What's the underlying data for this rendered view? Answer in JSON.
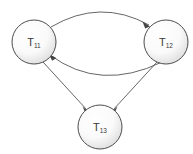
{
  "diagram": {
    "type": "directed-graph",
    "background_color": "#ffffff",
    "node_stroke_color": "#4d4d4d",
    "node_fill_light": "#fdfdfd",
    "node_fill_shadow": "#c9c9c9",
    "edge_color": "#555555",
    "label_color": "#3a3a3a",
    "nodes": [
      {
        "id": "T11",
        "label_base": "T",
        "label_subscript": "11",
        "cx": 34,
        "cy": 42,
        "r": 22
      },
      {
        "id": "T12",
        "label_base": "T",
        "label_subscript": "12",
        "cx": 166,
        "cy": 42,
        "r": 22
      },
      {
        "id": "T13",
        "label_base": "T",
        "label_subscript": "13",
        "cx": 100,
        "cy": 127,
        "r": 22
      }
    ],
    "edges": [
      {
        "id": "edge-t11-t12-top",
        "from": "T11",
        "to": "T12",
        "style": "curved-arc-upper",
        "directed": true
      },
      {
        "id": "edge-t12-t11-bottom",
        "from": "T12",
        "to": "T11",
        "style": "curved-arc-lower",
        "directed": true
      },
      {
        "id": "edge-t11-t13",
        "from": "T11",
        "to": "T13",
        "style": "straight",
        "directed": true
      },
      {
        "id": "edge-t12-t13",
        "from": "T12",
        "to": "T13",
        "style": "straight",
        "directed": true
      }
    ]
  }
}
